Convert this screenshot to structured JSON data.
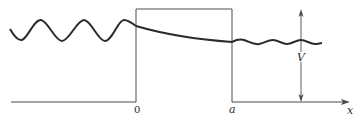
{
  "diagram": {
    "labels": {
      "origin": "0",
      "barrier_right": "a",
      "axis": "x",
      "height": "V"
    },
    "colors": {
      "line": "#4a4a4a",
      "wave": "#2b2b2b"
    },
    "regions": [
      {
        "name": "incident region",
        "x_range": "x < 0",
        "wave": "oscillating, large amplitude"
      },
      {
        "name": "barrier",
        "x_range": "0 < x < a",
        "wave": "exponential decay"
      },
      {
        "name": "transmitted region",
        "x_range": "x > a",
        "wave": "oscillating, small amplitude"
      }
    ]
  }
}
